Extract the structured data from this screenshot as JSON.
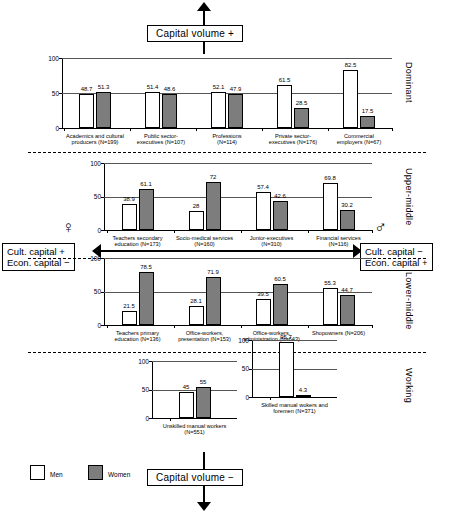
{
  "axes": {
    "capital_volume_top": "Capital volume +",
    "capital_volume_bottom": "Capital volume −",
    "left_box_line1": "Cult. capital +",
    "left_box_line2": "Econ. capital −",
    "right_box_line1": "Cult. capital −",
    "right_box_line2": "Econ. capital +",
    "female_symbol": "♀",
    "male_symbol": "♂"
  },
  "legend": {
    "items": [
      {
        "label": "Men",
        "color": "#ffffff"
      },
      {
        "label": "Women",
        "color": "#7d7d7d"
      }
    ]
  },
  "class_labels": [
    "Dominant",
    "Upper-middle",
    "Lower-middle",
    "Working"
  ],
  "chart_data": {
    "type": "bar",
    "title": "Capital volume +",
    "subtitle": "Capital volume −",
    "xlabel": "",
    "ylabel": "",
    "ylim": [
      0,
      100
    ],
    "yticks": [
      0,
      50,
      100
    ],
    "grid": true,
    "legend_position": "bottom-left",
    "series": [
      {
        "name": "Men",
        "color": "#ffffff"
      },
      {
        "name": "Women",
        "color": "#7d7d7d"
      }
    ],
    "panels": [
      {
        "class": "Dominant",
        "categories": [
          "Academics and cultural\nproducers (N=199)",
          "Public sector-\nexecutives (N=107)",
          "Professions\n(N=114)",
          "Private sector-\nexecutives (N=176)",
          "Commercial\nemployers (N=67)"
        ],
        "men": [
          48.7,
          51.4,
          52.1,
          61.5,
          82.5
        ],
        "women": [
          51.3,
          48.6,
          47.9,
          28.5,
          17.5
        ]
      },
      {
        "class": "Upper-middle",
        "categories": [
          "Teachers secondary\neducation (N=173)",
          "Socio-medical services\n(N=160)",
          "Junior-executives\n(N=310)",
          "Financial services\n(N=116)"
        ],
        "men": [
          38.9,
          28.0,
          57.4,
          69.8
        ],
        "women": [
          61.1,
          72.0,
          42.6,
          30.2
        ]
      },
      {
        "class": "Lower-middle",
        "categories": [
          "Teachers primary\neducation (N=136)",
          "Office-workers,\npresentation (N=153)",
          "Office-workers,\nadministration (N=643)",
          "Shopowners (N=206)"
        ],
        "men": [
          21.5,
          28.1,
          39.5,
          55.3
        ],
        "women": [
          78.5,
          71.9,
          60.5,
          44.7
        ]
      },
      {
        "class": "Working",
        "categories": [
          "Unskilled manual workers\n(N=551)",
          "Skilled manual wokers and\nforemen (N=371)"
        ],
        "men": [
          45.0,
          95.7
        ],
        "women": [
          55.0,
          4.3
        ]
      }
    ]
  }
}
